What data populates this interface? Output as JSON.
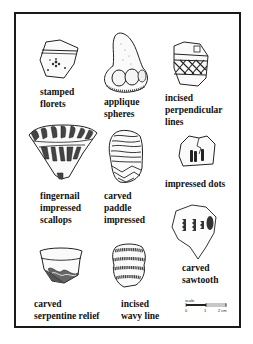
{
  "figure": {
    "sherds": [
      {
        "id": "stamped-florets",
        "label": "stamped\nflorets"
      },
      {
        "id": "applique-spheres",
        "label": "applique\nspheres"
      },
      {
        "id": "incised-perpendicular-lines",
        "label": "incised\nperpendicular\nlines"
      },
      {
        "id": "fingernail-impressed-scallops",
        "label": "fingernail\nimpressed\nscallops"
      },
      {
        "id": "carved-paddle-impressed",
        "label": "carved\npaddle\nimpressed"
      },
      {
        "id": "impressed-dots",
        "label": "impressed dots"
      },
      {
        "id": "carved-sawtooth",
        "label": "carved\nsawtooth"
      },
      {
        "id": "carved-serpentine-relief",
        "label": "carved\nserpentine relief"
      },
      {
        "id": "incised-wavy-line",
        "label": "incised\nwavy line"
      }
    ],
    "scale_bar": {
      "label": "scale",
      "ticks": [
        "0",
        "1",
        "2 cm"
      ]
    }
  }
}
